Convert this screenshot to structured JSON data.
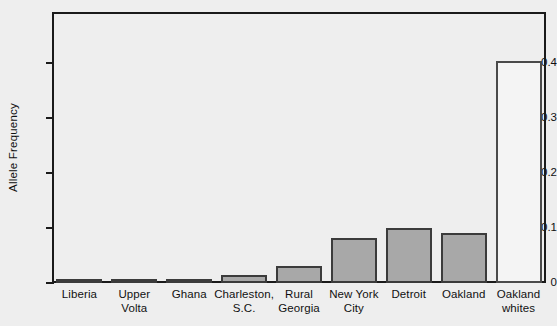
{
  "chart_data": {
    "type": "bar",
    "title": "",
    "xlabel": "",
    "ylabel": "Allele Frequency",
    "ylim": [
      0,
      0.493
    ],
    "yticks": [
      0,
      0.1,
      0.2,
      0.3,
      0.4
    ],
    "ytick_labels": [
      "0",
      "0.1",
      "0.2",
      "0.3",
      "0.4"
    ],
    "grid": false,
    "legend": "none",
    "categories": [
      "Liberia",
      "Upper Volta",
      "Ghana",
      "Charleston, S.C.",
      "Rural Georgia",
      "New York City",
      "Detroit",
      "Oakland",
      "Oakland whites"
    ],
    "category_lines": [
      [
        "Liberia",
        ""
      ],
      [
        "Upper",
        "Volta"
      ],
      [
        "Ghana",
        ""
      ],
      [
        "Charleston,",
        "S.C."
      ],
      [
        "Rural",
        "Georgia"
      ],
      [
        "New York",
        "City"
      ],
      [
        "Detroit",
        ""
      ],
      [
        "Oakland",
        ""
      ],
      [
        "Oakland",
        "whites"
      ]
    ],
    "values": [
      0.003,
      0.003,
      0.006,
      0.015,
      0.031,
      0.082,
      0.1,
      0.091,
      0.404
    ],
    "bar_styles": [
      "filled",
      "filled",
      "filled",
      "filled",
      "filled",
      "filled",
      "filled",
      "filled",
      "unfilled"
    ],
    "colors": {
      "bar_fill": "#a8a8a8",
      "bar_edge": "#3b3b3b",
      "bar_unfilled_fill": "#f4f4f4",
      "axis": "#1a1a1a",
      "background": "#eeeeee",
      "text": "#111111"
    }
  }
}
